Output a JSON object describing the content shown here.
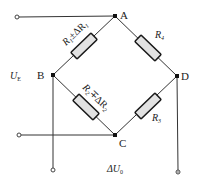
{
  "diagram": {
    "type": "wheatstone-bridge",
    "nodes": {
      "A": "A",
      "B": "B",
      "C": "C",
      "D": "D"
    },
    "resistors": {
      "r1": {
        "main": "R",
        "sub": "1",
        "delta": "±ΔR",
        "delta_sub": "1",
        "full": "R1 ± ΔR1"
      },
      "r2": {
        "main": "R",
        "sub": "2",
        "delta": "∓ΔR",
        "delta_sub": "2",
        "full": "R2 ∓ ΔR2"
      },
      "r3": {
        "main": "R",
        "sub": "3",
        "full": "R3"
      },
      "r4": {
        "main": "R",
        "sub": "4",
        "full": "R4"
      }
    },
    "supply_label": {
      "main": "U",
      "sub": "E"
    },
    "output_label": {
      "main": "ΔU",
      "sub": "0"
    },
    "colors": {
      "wire": "#333333",
      "resistor_fill": "#e2e2e2",
      "resistor_stroke": "#1a1a1a",
      "node": "#111111"
    }
  }
}
